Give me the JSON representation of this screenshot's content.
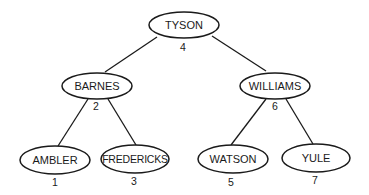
{
  "diagram": {
    "type": "binary-search-tree",
    "nodes": [
      {
        "id": "tyson",
        "label": "TYSON",
        "index": "4",
        "cx": 184,
        "cy": 25,
        "rx": 35,
        "ry": 13
      },
      {
        "id": "barnes",
        "label": "BARNES",
        "index": "2",
        "cx": 97,
        "cy": 86,
        "rx": 35,
        "ry": 13
      },
      {
        "id": "williams",
        "label": "WILLIAMS",
        "index": "6",
        "cx": 275,
        "cy": 86,
        "rx": 35,
        "ry": 13
      },
      {
        "id": "ambler",
        "label": "AMBLER",
        "index": "1",
        "cx": 55,
        "cy": 160,
        "rx": 35,
        "ry": 14
      },
      {
        "id": "fredericks",
        "label": "FREDERICKS",
        "index": "3",
        "cx": 135,
        "cy": 159,
        "rx": 34,
        "ry": 14
      },
      {
        "id": "watson",
        "label": "WATSON",
        "index": "5",
        "cx": 233,
        "cy": 159,
        "rx": 35,
        "ry": 14
      },
      {
        "id": "yule",
        "label": "YULE",
        "index": "7",
        "cx": 316,
        "cy": 158,
        "rx": 34,
        "ry": 14
      }
    ],
    "edges": [
      {
        "from": "tyson",
        "to": "barnes"
      },
      {
        "from": "tyson",
        "to": "williams"
      },
      {
        "from": "barnes",
        "to": "ambler"
      },
      {
        "from": "barnes",
        "to": "fredericks"
      },
      {
        "from": "williams",
        "to": "watson"
      },
      {
        "from": "williams",
        "to": "yule"
      }
    ]
  }
}
